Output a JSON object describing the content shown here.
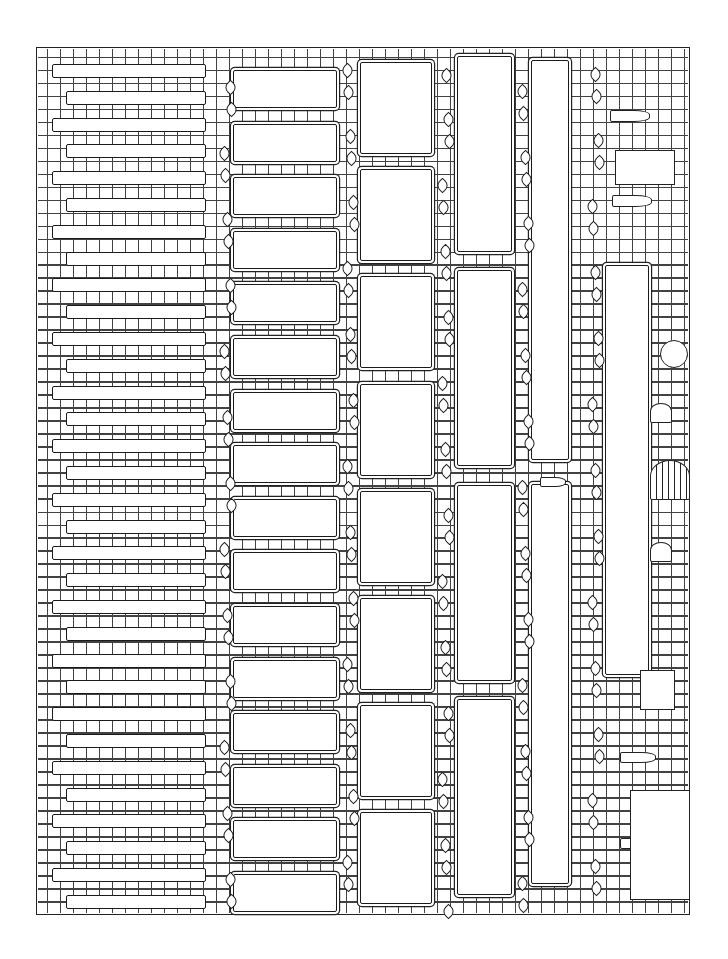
{
  "document": {
    "type": "blank illustrated pedigree chart",
    "style": "black line art stone wall with ivy vines, rotated layout",
    "colors": {
      "ink": "#1a1a1a",
      "paper": "#ffffff"
    }
  },
  "frame": {
    "x": 36,
    "y": 47,
    "width": 654,
    "height": 868
  },
  "generations": [
    {
      "name": "generation-6",
      "slot_count": 32,
      "x": 66,
      "width": 140,
      "slot_height": 14,
      "top": 64,
      "pitch": 26.8
    },
    {
      "name": "generation-5",
      "slot_count": 16,
      "x": 233,
      "width": 104,
      "slot_height": 38,
      "top": 70,
      "pitch": 53.6
    },
    {
      "name": "generation-4",
      "slot_count": 8,
      "x": 360,
      "width": 72,
      "slot_height": 92,
      "top": 62,
      "pitch": 107.2
    },
    {
      "name": "generation-3",
      "slot_count": 4,
      "x": 457,
      "width": 55,
      "slot_height": 196,
      "top": 56,
      "pitch": 214.4
    },
    {
      "name": "generation-2",
      "slot_count": 2,
      "x": 531,
      "width": 38,
      "slot_height": 400,
      "top": 60,
      "pitch": 424
    },
    {
      "name": "generation-1",
      "slot_count": 1,
      "x": 605,
      "width": 44,
      "slot_height": 410,
      "top": 265,
      "pitch": 0
    }
  ],
  "decorations": [
    {
      "name": "plaque-top-1",
      "x": 610,
      "y": 110,
      "w": 40,
      "h": 12
    },
    {
      "name": "plaque-top-2",
      "x": 612,
      "y": 195,
      "w": 40,
      "h": 12
    },
    {
      "name": "plaque-middle",
      "x": 540,
      "y": 477,
      "w": 26,
      "h": 10
    },
    {
      "name": "plaque-bottom-1",
      "x": 620,
      "y": 752,
      "w": 36,
      "h": 11
    },
    {
      "name": "plaque-bottom-2",
      "x": 620,
      "y": 838,
      "w": 36,
      "h": 11
    },
    {
      "name": "barred-window",
      "x": 650,
      "y": 460,
      "w": 40,
      "h": 40
    },
    {
      "name": "arched-window-1",
      "x": 650,
      "y": 403,
      "w": 22,
      "h": 20
    },
    {
      "name": "arched-window-2",
      "x": 650,
      "y": 542,
      "w": 22,
      "h": 20
    },
    {
      "name": "cannon-wheel",
      "x": 660,
      "y": 340,
      "w": 28,
      "h": 28
    },
    {
      "name": "jester-figure",
      "x": 615,
      "y": 150,
      "w": 60,
      "h": 35
    },
    {
      "name": "dragon",
      "x": 630,
      "y": 790,
      "w": 60,
      "h": 110
    },
    {
      "name": "unicorn-creature",
      "x": 640,
      "y": 670,
      "w": 35,
      "h": 40
    }
  ]
}
